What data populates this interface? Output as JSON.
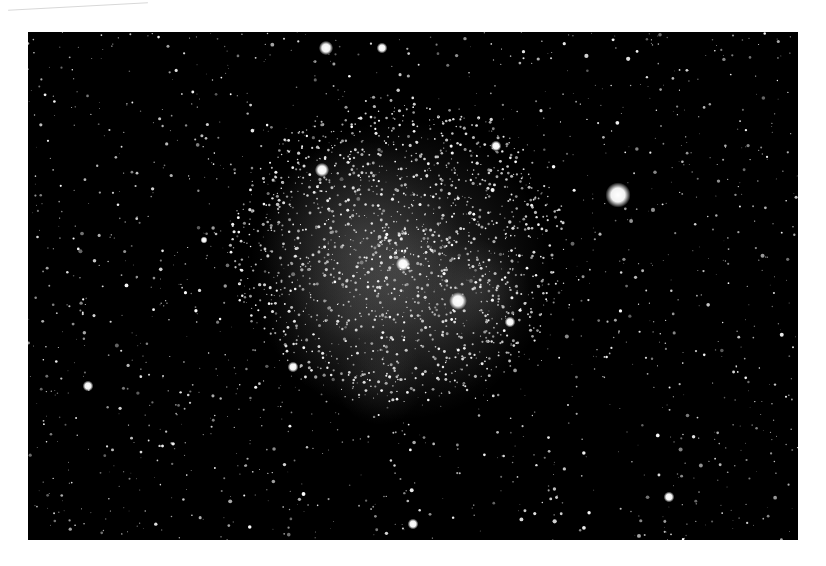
{
  "image": {
    "subject": "star field with emission nebula",
    "background_color": "#ffffff",
    "photo_background": "#000000",
    "nebula": {
      "cx": 400,
      "cy": 270,
      "color": "#c8c8c8"
    },
    "bright_stars": [
      {
        "x": 618,
        "y": 195,
        "r": 7
      },
      {
        "x": 458,
        "y": 301,
        "r": 5
      },
      {
        "x": 403,
        "y": 264,
        "r": 4
      },
      {
        "x": 322,
        "y": 170,
        "r": 4
      },
      {
        "x": 326,
        "y": 48,
        "r": 4
      },
      {
        "x": 88,
        "y": 386,
        "r": 3
      },
      {
        "x": 496,
        "y": 146,
        "r": 3
      },
      {
        "x": 510,
        "y": 322,
        "r": 3
      },
      {
        "x": 293,
        "y": 367,
        "r": 3
      },
      {
        "x": 413,
        "y": 524,
        "r": 3
      },
      {
        "x": 669,
        "y": 497,
        "r": 3
      },
      {
        "x": 382,
        "y": 48,
        "r": 3
      },
      {
        "x": 204,
        "y": 240,
        "r": 2
      }
    ]
  }
}
